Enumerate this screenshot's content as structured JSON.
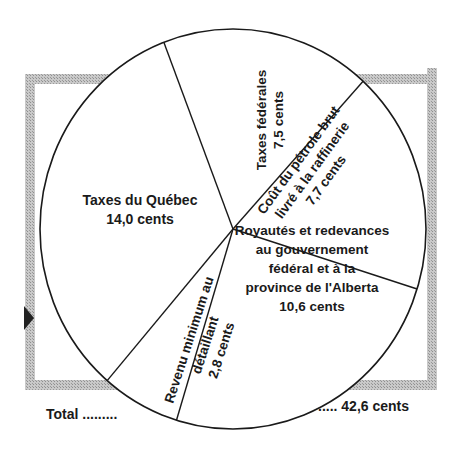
{
  "chart_data": {
    "type": "pie",
    "title": "",
    "unit": "cents",
    "categories": [
      "Taxes fédérales",
      "Coût du pétrole brut livré à la raffinerie",
      "Royautés et redevances au gouvernement fédéral et à la province de l'Alberta",
      "Revenu minimum au détaillant",
      "Taxes du Québec"
    ],
    "values": [
      7.5,
      7.7,
      10.6,
      2.8,
      14.0
    ],
    "total": 42.6,
    "legend": "none (labels inside slices)"
  },
  "slices": [
    {
      "lines": [
        "Taxes fédérales",
        "7,5 cents"
      ]
    },
    {
      "lines": [
        "Coût du pétrole brut",
        "livré à la raffinerie",
        "7,7 cents"
      ]
    },
    {
      "lines": [
        "Royautés et redevances",
        "au gouvernement",
        "fédéral et à la",
        "province de l'Alberta",
        "10,6 cents"
      ]
    },
    {
      "lines": [
        "Revenu minimum au",
        "détaillant",
        "2,8 cents"
      ]
    },
    {
      "lines": [
        "Taxes du Québec",
        "14,0 cents"
      ]
    }
  ],
  "total_left": "Total .........",
  "total_right": "..... 42,6 cents",
  "colors": {
    "frame": "#b8b8b8",
    "line": "#1a1a1a",
    "fill": "#ffffff"
  }
}
